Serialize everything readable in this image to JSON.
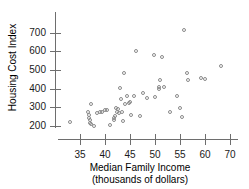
{
  "chart_data": {
    "type": "scatter",
    "title": "",
    "xlabel": "Median Family Income",
    "xlabel_sub": "(thousands of dollars)",
    "ylabel": "Housing Cost Index",
    "xlim": [
      32,
      67
    ],
    "ylim": [
      170,
      730
    ],
    "grid": false,
    "legend": "none",
    "marker": "open-circle",
    "marker_color": "#8a8a8a",
    "axis_color": "#6e6e6e",
    "xticks": [
      {
        "value": 35,
        "label": "35",
        "px": 80
      },
      {
        "value": 40,
        "label": "40",
        "px": 105
      },
      {
        "value": 45,
        "label": "45",
        "px": 130
      },
      {
        "value": 50,
        "label": "50",
        "px": 155
      },
      {
        "value": 55,
        "label": "55",
        "px": 180
      },
      {
        "value": 60,
        "label": "60",
        "px": 205
      },
      {
        "value": 65,
        "label": "70",
        "px": 230
      }
    ],
    "yticks": [
      {
        "value": 200,
        "label": "200",
        "px": 126
      },
      {
        "value": 300,
        "label": "300",
        "px": 107
      },
      {
        "value": 400,
        "label": "400",
        "px": 89
      },
      {
        "value": 500,
        "label": "500",
        "px": 70
      },
      {
        "value": 600,
        "label": "600",
        "px": 51
      },
      {
        "value": 700,
        "label": "700",
        "px": 33
      }
    ],
    "points": [
      {
        "x": 33.2,
        "y": 218
      },
      {
        "x": 36.8,
        "y": 272
      },
      {
        "x": 36.9,
        "y": 255
      },
      {
        "x": 37.0,
        "y": 240
      },
      {
        "x": 37.1,
        "y": 228
      },
      {
        "x": 37.2,
        "y": 213
      },
      {
        "x": 37.4,
        "y": 205
      },
      {
        "x": 37.3,
        "y": 315
      },
      {
        "x": 38.0,
        "y": 196
      },
      {
        "x": 38.6,
        "y": 262
      },
      {
        "x": 39.2,
        "y": 272
      },
      {
        "x": 39.6,
        "y": 268
      },
      {
        "x": 40.2,
        "y": 281
      },
      {
        "x": 40.6,
        "y": 279
      },
      {
        "x": 41.1,
        "y": 202
      },
      {
        "x": 41.9,
        "y": 235
      },
      {
        "x": 42.0,
        "y": 225
      },
      {
        "x": 42.1,
        "y": 246
      },
      {
        "x": 42.3,
        "y": 292
      },
      {
        "x": 42.6,
        "y": 268
      },
      {
        "x": 42.8,
        "y": 284
      },
      {
        "x": 43.0,
        "y": 262
      },
      {
        "x": 43.2,
        "y": 397
      },
      {
        "x": 43.4,
        "y": 340
      },
      {
        "x": 43.6,
        "y": 272
      },
      {
        "x": 43.7,
        "y": 222
      },
      {
        "x": 43.9,
        "y": 478
      },
      {
        "x": 44.2,
        "y": 312
      },
      {
        "x": 44.6,
        "y": 355
      },
      {
        "x": 44.9,
        "y": 318
      },
      {
        "x": 45.1,
        "y": 322
      },
      {
        "x": 45.3,
        "y": 252
      },
      {
        "x": 46.0,
        "y": 358
      },
      {
        "x": 46.4,
        "y": 597
      },
      {
        "x": 47.2,
        "y": 248
      },
      {
        "x": 47.8,
        "y": 370
      },
      {
        "x": 48.6,
        "y": 345
      },
      {
        "x": 49.9,
        "y": 575
      },
      {
        "x": 50.2,
        "y": 348
      },
      {
        "x": 50.9,
        "y": 403
      },
      {
        "x": 51.0,
        "y": 392
      },
      {
        "x": 51.1,
        "y": 440
      },
      {
        "x": 51.6,
        "y": 565
      },
      {
        "x": 52.0,
        "y": 402
      },
      {
        "x": 53.2,
        "y": 268
      },
      {
        "x": 54.5,
        "y": 356
      },
      {
        "x": 55.2,
        "y": 290
      },
      {
        "x": 55.6,
        "y": 241
      },
      {
        "x": 55.9,
        "y": 712
      },
      {
        "x": 56.5,
        "y": 478
      },
      {
        "x": 56.8,
        "y": 441
      },
      {
        "x": 59.4,
        "y": 452
      },
      {
        "x": 60.2,
        "y": 450
      },
      {
        "x": 63.4,
        "y": 516
      }
    ]
  }
}
